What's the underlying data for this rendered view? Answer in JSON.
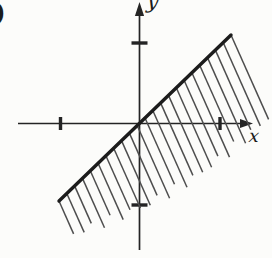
{
  "figure": {
    "type": "coordinate-plane-half-plane-region",
    "background": "#fcfcfa",
    "axis_color": "#242424",
    "line_color": "#1c1c1c",
    "hatch_color": "#4e4e4e",
    "label_color": "#1c1c1c",
    "canvas": {
      "width": 272,
      "height": 258
    },
    "labels": {
      "x_axis": "x",
      "y_axis": "y",
      "corner_fragment": ")"
    },
    "origin": {
      "x": 139.5,
      "y": 123.5
    },
    "x_axis": {
      "from": 18,
      "to": 253,
      "arrow_len": 13,
      "arrow_halfwidth": 4.6,
      "ticks": [
        60.5,
        220
      ]
    },
    "y_axis": {
      "from": 250,
      "to": 2,
      "arrow_len": 14,
      "arrow_halfwidth": 4.6,
      "ticks": [
        43,
        205
      ]
    },
    "tick_style": {
      "x_tick_halflen": 6.5,
      "y_tick_halflen": 8,
      "stroke_width": 3.4
    },
    "boundary_line": {
      "x1": 59,
      "y1": 201,
      "x2": 231,
      "y2": 35,
      "stroke_width": 3.4
    },
    "hatch": {
      "count": 23,
      "angle_deg": 66,
      "base_length": 36,
      "length_growth": 55,
      "sag": 14,
      "jitter": 5,
      "stroke_width": 1.5
    },
    "semantics": {
      "boundary_passes_through_origin": true,
      "boundary_style": "solid-bold",
      "shaded_side": "below-right-of-line",
      "shading_style": "parallel-hatch-strokes",
      "unlabeled_ticks": {
        "x": 2,
        "y": 2
      }
    }
  }
}
